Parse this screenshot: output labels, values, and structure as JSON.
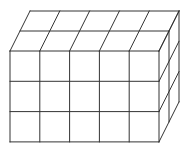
{
  "diagram": {
    "cubes": {
      "width": 5,
      "height": 3,
      "depth": 2
    },
    "stroke_color": "#333333",
    "background": "#ffffff",
    "geometry": {
      "origin_x": 10,
      "origin_y": 51,
      "cell_w": 29.8,
      "cell_h": 30.3,
      "depth_dx": 10,
      "depth_dy": -20
    }
  }
}
